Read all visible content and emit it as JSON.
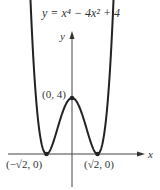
{
  "title": "y = x⁴ − 4x² + 4",
  "axes": {
    "x_label": "x",
    "y_label": "y"
  },
  "points": [
    {
      "label": "(0, 4)",
      "x": 0,
      "y": 4
    },
    {
      "label": "(−√2, 0)",
      "x": -1.414,
      "y": 0
    },
    {
      "label": "(√2, 0)",
      "x": 1.414,
      "y": 0
    }
  ],
  "colors": {
    "curve": "#222222",
    "axis": "#444444"
  }
}
